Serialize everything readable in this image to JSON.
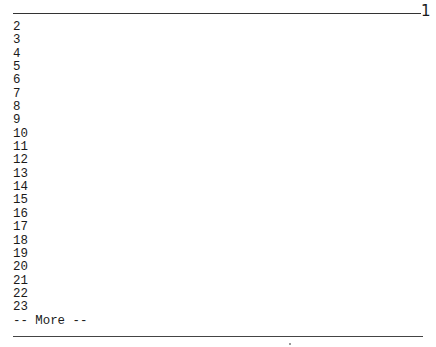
{
  "header": {
    "page_number": "1"
  },
  "pager": {
    "lines": [
      "2",
      "3",
      "4",
      "5",
      "6",
      "7",
      "8",
      "9",
      "10",
      "11",
      "12",
      "13",
      "14",
      "15",
      "16",
      "17",
      "18",
      "19",
      "20",
      "21",
      "22",
      "23"
    ],
    "more_prompt": "-- More --"
  }
}
